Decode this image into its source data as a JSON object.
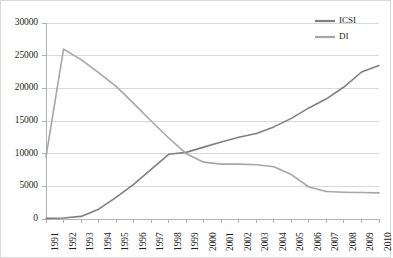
{
  "chart_data": {
    "type": "line",
    "title": "",
    "xlabel": "",
    "ylabel": "",
    "categories": [
      "1991",
      "1992",
      "1993",
      "1994",
      "1995",
      "1996",
      "1997",
      "1998",
      "1999",
      "2000",
      "2001",
      "2002",
      "2003",
      "2004",
      "2005",
      "2006",
      "2007",
      "2008",
      "2009",
      "2010"
    ],
    "yticks": [
      "0",
      "5000",
      "10000",
      "15000",
      "20000",
      "25000",
      "30000"
    ],
    "ylim": [
      0,
      30000
    ],
    "grid": "horizontal",
    "legend_position": "top-right",
    "series": [
      {
        "name": "ICSI",
        "color": "#7f7f7f",
        "values": [
          100,
          150,
          400,
          1500,
          3300,
          5300,
          7600,
          9900,
          10200,
          11000,
          11800,
          12500,
          13100,
          14100,
          15400,
          17000,
          18400,
          20200,
          22500,
          23500
        ]
      },
      {
        "name": "DI",
        "color": "#a6a6a6",
        "values": [
          9500,
          26000,
          24400,
          22400,
          20300,
          17700,
          15000,
          12400,
          10000,
          8700,
          8400,
          8400,
          8300,
          8000,
          6800,
          4900,
          4200,
          4100,
          4050,
          4000
        ]
      }
    ]
  },
  "legend": {
    "items": [
      {
        "label": "ICSI"
      },
      {
        "label": "DI"
      }
    ]
  }
}
